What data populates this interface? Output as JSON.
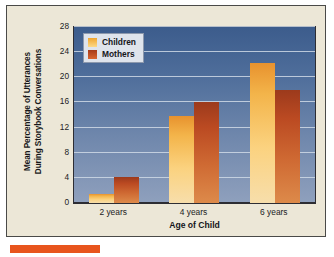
{
  "chart_data": {
    "type": "bar",
    "title": "",
    "xlabel": "Age of Child",
    "ylabel": "Mean Percentage of Utterances During Storybook Conversations",
    "ylabel_line1": "Mean Percentage of Utterances",
    "ylabel_line2": "During Storybook Conversations",
    "categories": [
      "2 years",
      "4 years",
      "6 years"
    ],
    "series": [
      {
        "name": "Children",
        "values": [
          1.5,
          13.8,
          22.2
        ],
        "color": "#f3b44a"
      },
      {
        "name": "Mothers",
        "values": [
          4.2,
          16.0,
          18.0
        ],
        "color": "#c3552a"
      }
    ],
    "ylim": [
      0,
      28
    ],
    "yticks": [
      0,
      4,
      8,
      12,
      16,
      20,
      24,
      28
    ],
    "grid": true,
    "legend_position": "top-left"
  },
  "legend": {
    "items": [
      {
        "label": "Children"
      },
      {
        "label": "Mothers"
      }
    ]
  },
  "colors": {
    "page_background": "#ece7d7",
    "plot_top": "#3c5c8c",
    "plot_bottom": "#8fa0bd",
    "children_bar": "#f3b44a",
    "mothers_bar": "#c3552a",
    "accent": "#e8551d",
    "gridline": "#cfd9e6",
    "axis": "#2d2d33"
  }
}
